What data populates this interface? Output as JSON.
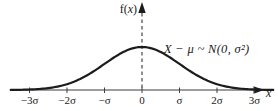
{
  "figure": {
    "background": "#ffffff",
    "curve_color": "#1c1c1c",
    "axis_color": "#3d3d3d",
    "text_color": "#1a1a1a"
  },
  "chart_data": {
    "type": "line",
    "title": "",
    "subtitle": "",
    "xlabel": "x",
    "ylabel": "f(x)",
    "ylabel_parts": {
      "prefix": "f(",
      "var": "x",
      "suffix": ")"
    },
    "annotation": "X − μ ~ N(0, σ²)",
    "distribution": "normal",
    "mean_label": "0",
    "variance_label": "σ²",
    "x_ticks": [
      "−3σ",
      "−2σ",
      "−σ",
      "0",
      "σ",
      "2σ",
      "3σ"
    ],
    "x_tick_values": [
      -3,
      -2,
      -1,
      0,
      1,
      2,
      3
    ],
    "xlim": [
      -3.5,
      3.5
    ],
    "ylim": [
      0,
      1.1
    ],
    "grid": false,
    "legend": false,
    "zero_line": "dashed",
    "series": [
      {
        "name": "normal pdf (peak-normalized)",
        "x": [
          -3.5,
          -3,
          -2.5,
          -2,
          -1.5,
          -1,
          -0.5,
          0,
          0.5,
          1,
          1.5,
          2,
          2.5,
          3,
          3.5
        ],
        "y": [
          0.0022,
          0.0111,
          0.0439,
          0.1353,
          0.3247,
          0.6065,
          0.8825,
          1.0,
          0.8825,
          0.6065,
          0.3247,
          0.1353,
          0.0439,
          0.0111,
          0.0022
        ]
      }
    ]
  }
}
